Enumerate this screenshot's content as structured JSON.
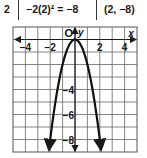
{
  "table_row": {
    "x": "2",
    "expression": "−2(2)² = −8",
    "point": "(2, −8)"
  },
  "chart_data": {
    "type": "line",
    "title": "",
    "function": "y = -2x^2",
    "xlabel": "x",
    "ylabel": "y",
    "origin_label": "O",
    "xlim": [
      -5,
      5
    ],
    "ylim": [
      -9,
      1
    ],
    "grid": true,
    "x_ticks": [
      -4,
      -2,
      2,
      4
    ],
    "x_tick_labels": [
      "−4",
      "−2",
      "2",
      "4"
    ],
    "y_ticks": [
      -4,
      -6,
      -8
    ],
    "y_tick_labels": [
      "−4",
      "−6",
      "−8"
    ],
    "series": [
      {
        "name": "y = -2x^2",
        "x": [
          -2.1,
          -2,
          -1.5,
          -1,
          -0.5,
          0,
          0.5,
          1,
          1.5,
          2,
          2.1
        ],
        "y": [
          -8.82,
          -8,
          -4.5,
          -2,
          -0.5,
          0,
          -0.5,
          -2,
          -4.5,
          -8,
          -8.82
        ]
      }
    ],
    "annotations": [
      "arrowheads at both ends of curve",
      "arrowheads on both axes"
    ]
  }
}
